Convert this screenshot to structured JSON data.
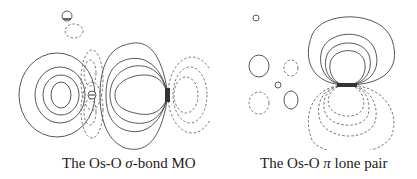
{
  "figure": {
    "panels": [
      {
        "id": "sigma-bond",
        "caption_prefix": "The Os-O ",
        "caption_symbol": "σ",
        "caption_suffix": "-bond MO",
        "legend": {
          "solid": "positive lobe",
          "dashed": "negative lobe"
        },
        "atom_markers": [
          "⊕",
          "⊖",
          "⊕"
        ]
      },
      {
        "id": "pi-lone-pair",
        "caption_prefix": "The Os-O ",
        "caption_symbol": "π",
        "caption_suffix": " lone pair",
        "atom_markers": [
          "⊕",
          "⊕"
        ]
      }
    ],
    "colors": {
      "solid_contour": "#444444",
      "dashed_contour": "#666666",
      "background": "#ffffff"
    }
  }
}
